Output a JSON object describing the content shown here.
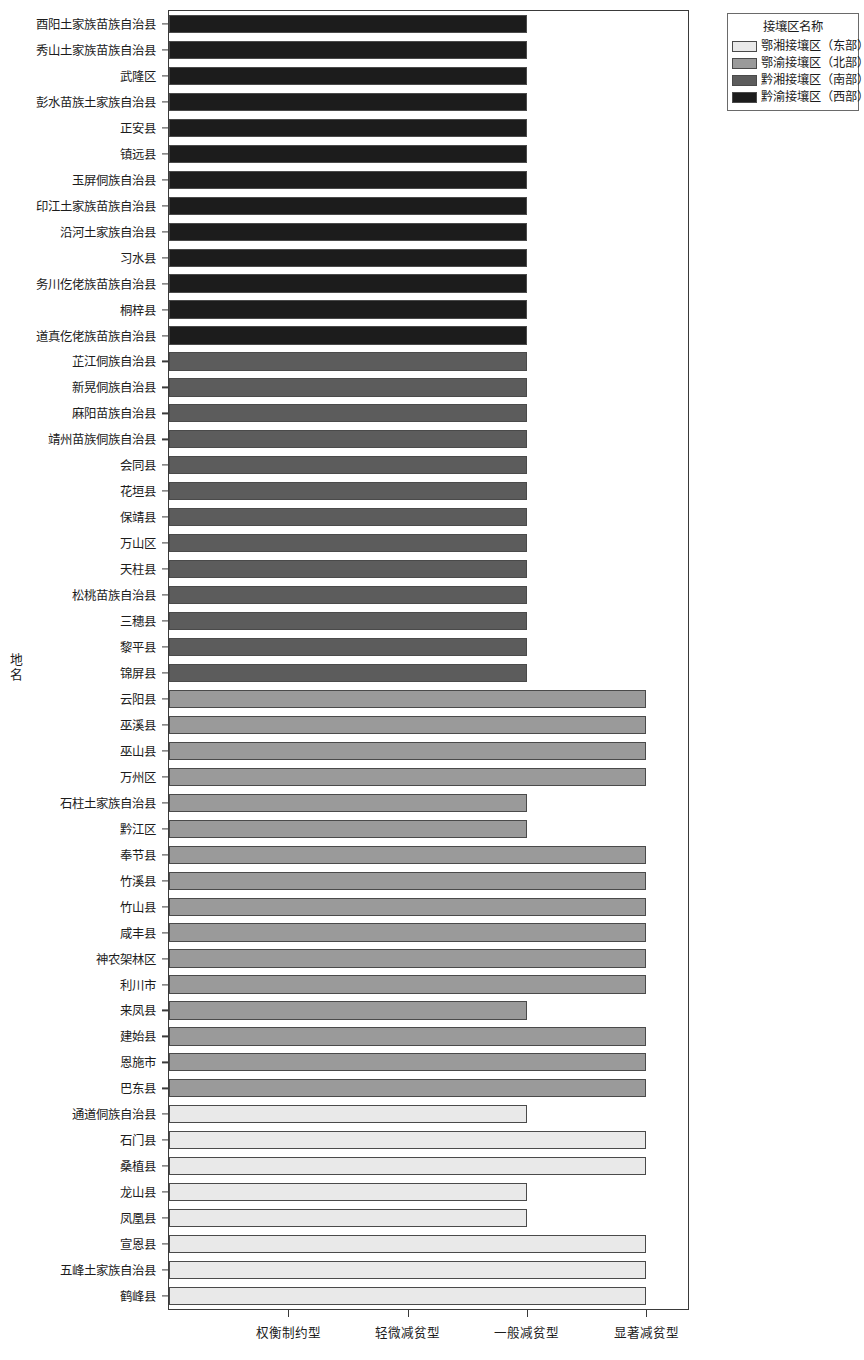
{
  "chart_data": {
    "type": "bar",
    "orientation": "horizontal",
    "title": "",
    "xlabel": "",
    "ylabel": "地名",
    "grid": false,
    "legend_position": "top-right",
    "x_tick_labels": [
      "权衡制约型",
      "轻微减贫型",
      "一般减贫型",
      "显著减贫型"
    ],
    "x_tick_values": [
      1,
      2,
      3,
      4
    ],
    "xlim": [
      0,
      4.35
    ],
    "legend": {
      "title": "接壤区名称",
      "entries": [
        {
          "label": "鄂湘接壤区（东部）",
          "color": "#e9e9e9"
        },
        {
          "label": "鄂渝接壤区（北部）",
          "color": "#9a9a9a"
        },
        {
          "label": "黔湘接壤区（南部）",
          "color": "#5c5c5c"
        },
        {
          "label": "黔渝接壤区（西部）",
          "color": "#1c1c1c"
        }
      ]
    },
    "categories": [
      "酉阳土家族苗族自治县",
      "秀山土家族苗族自治县",
      "武隆区",
      "彭水苗族土家族自治县",
      "正安县",
      "镇远县",
      "玉屏侗族自治县",
      "印江土家族苗族自治县",
      "沿河土家族自治县",
      "习水县",
      "务川仡佬族苗族自治县",
      "桐梓县",
      "道真仡佬族苗族自治县",
      "芷江侗族自治县",
      "新晃侗族自治县",
      "麻阳苗族自治县",
      "靖州苗族侗族自治县",
      "会同县",
      "花垣县",
      "保靖县",
      "万山区",
      "天柱县",
      "松桃苗族自治县",
      "三穗县",
      "黎平县",
      "锦屏县",
      "云阳县",
      "巫溪县",
      "巫山县",
      "万州区",
      "石柱土家族自治县",
      "黔江区",
      "奉节县",
      "竹溪县",
      "竹山县",
      "咸丰县",
      "神农架林区",
      "利川市",
      "来凤县",
      "建始县",
      "恩施市",
      "巴东县",
      "通道侗族自治县",
      "石门县",
      "桑植县",
      "龙山县",
      "凤凰县",
      "宣恩县",
      "五峰土家族自治县",
      "鹤峰县"
    ],
    "values": [
      3,
      3,
      3,
      3,
      3,
      3,
      3,
      3,
      3,
      3,
      3,
      3,
      3,
      3,
      3,
      3,
      3,
      3,
      3,
      3,
      3,
      3,
      3,
      3,
      3,
      3,
      4,
      4,
      4,
      4,
      3,
      3,
      4,
      4,
      4,
      4,
      4,
      4,
      3,
      4,
      4,
      4,
      3,
      4,
      4,
      3,
      3,
      4,
      4,
      4
    ],
    "series_index": [
      3,
      3,
      3,
      3,
      3,
      3,
      3,
      3,
      3,
      3,
      3,
      3,
      3,
      2,
      2,
      2,
      2,
      2,
      2,
      2,
      2,
      2,
      2,
      2,
      2,
      2,
      1,
      1,
      1,
      1,
      1,
      1,
      1,
      1,
      1,
      1,
      1,
      1,
      1,
      1,
      1,
      1,
      0,
      0,
      0,
      0,
      0,
      0,
      0,
      0
    ]
  }
}
